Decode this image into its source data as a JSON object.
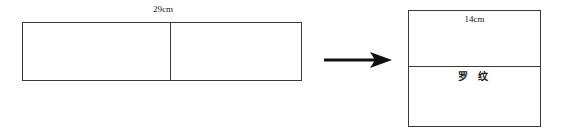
{
  "diagram": {
    "title": "",
    "background_color": "#ffffff",
    "line_color": "#3a3a3a",
    "text_color": "#222222",
    "left_figure": {
      "name": "unfolded-panel",
      "width_label": "29cm",
      "has_center_fold_line": true,
      "cells": [
        {
          "label": ""
        },
        {
          "label": ""
        }
      ]
    },
    "arrow": {
      "name": "transform-arrow",
      "direction": "right",
      "label": ""
    },
    "right_figure": {
      "name": "folded-panel",
      "top_cell": {
        "label": "14cm"
      },
      "bottom_cell": {
        "label": "罗 纹"
      }
    }
  }
}
